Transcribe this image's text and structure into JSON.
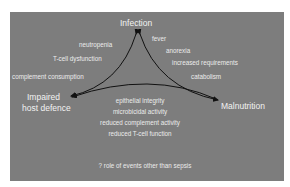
{
  "nodes": {
    "top": "Infection",
    "left_line1": "Impaired",
    "left_line2": "host defence",
    "right": "Malnutrition"
  },
  "edges": {
    "infection_to_impaired": [
      "neutropenia",
      "T-cell dysfunction",
      "complement consumption"
    ],
    "infection_to_malnutrition": [
      "fever",
      "anorexia",
      "increased requirements",
      "catabolism"
    ],
    "malnutrition_to_impaired": [
      "epithelial integrity",
      "microbicidal activity",
      "reduced complement activity",
      "reduced T-cell function"
    ]
  },
  "footnote": "? role of events other than sepsis",
  "colors": {
    "panel": "#7d7d7d",
    "text": "#f2f2f2",
    "arrow": "#111111"
  }
}
